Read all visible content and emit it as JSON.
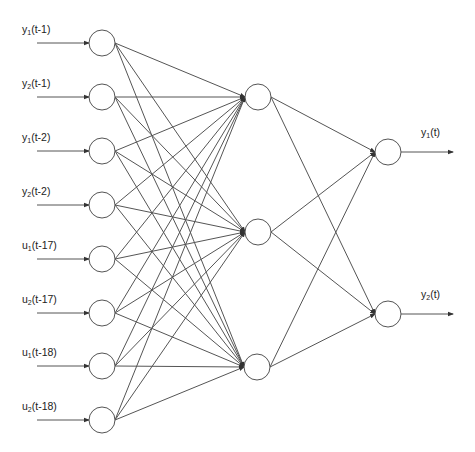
{
  "diagram": {
    "type": "neural-network",
    "line_color": "#555555",
    "node_stroke": "#555555",
    "node_fill": "#ffffff",
    "node_radius": 13,
    "layers": {
      "input": [
        {
          "var": "y",
          "sub": "1",
          "lag": "(t-1)",
          "x": 102,
          "y": 43
        },
        {
          "var": "y",
          "sub": "2",
          "lag": "(t-1)",
          "x": 102,
          "y": 97
        },
        {
          "var": "y",
          "sub": "1",
          "lag": "(t-2)",
          "x": 102,
          "y": 151
        },
        {
          "var": "y",
          "sub": "2",
          "lag": "(t-2)",
          "x": 102,
          "y": 205
        },
        {
          "var": "u",
          "sub": "1",
          "lag": "(t-17)",
          "x": 102,
          "y": 259
        },
        {
          "var": "u",
          "sub": "2",
          "lag": "(t-17)",
          "x": 102,
          "y": 313
        },
        {
          "var": "u",
          "sub": "1",
          "lag": "(t-18)",
          "x": 102,
          "y": 366
        },
        {
          "var": "u",
          "sub": "2",
          "lag": "(t-18)",
          "x": 102,
          "y": 420
        }
      ],
      "hidden": [
        {
          "x": 258,
          "y": 97
        },
        {
          "x": 258,
          "y": 232
        },
        {
          "x": 257,
          "y": 367
        }
      ],
      "output": [
        {
          "var": "y",
          "sub": "1",
          "lag": "(t)",
          "x": 388,
          "y": 152
        },
        {
          "var": "y",
          "sub": "2",
          "lag": "(t)",
          "x": 388,
          "y": 314
        }
      ]
    },
    "connections": {
      "input_to_hidden": "fully-connected",
      "hidden_to_output": "fully-connected"
    }
  }
}
